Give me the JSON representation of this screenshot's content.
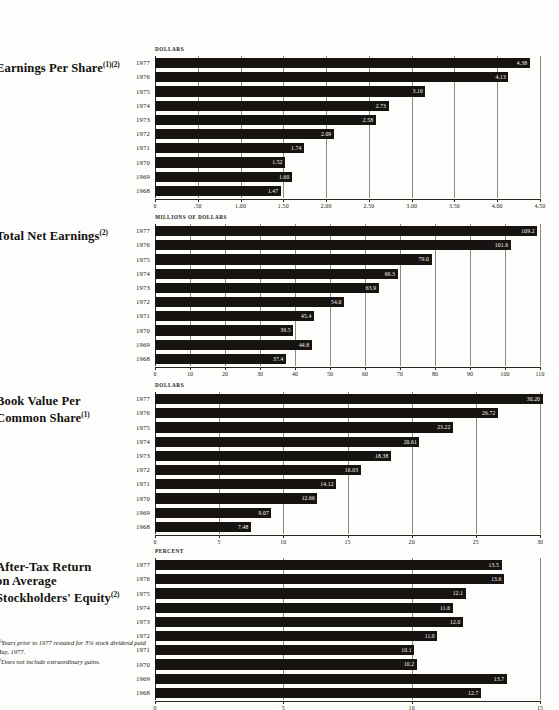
{
  "charts": [
    {
      "id": "earnings-per-share",
      "title_lines": [
        "Earnings Per Share"
      ],
      "title_sup": "(1)(2)",
      "unit_caption": "DOLLARS",
      "chart_data": {
        "type": "bar",
        "orientation": "horizontal",
        "title": "Earnings Per Share",
        "xlabel": "DOLLARS",
        "ylabel": "",
        "xlim": [
          0,
          4.5
        ],
        "grid": true,
        "legend": "none",
        "categories": [
          "1977",
          "1976",
          "1975",
          "1974",
          "1973",
          "1972",
          "1971",
          "1970",
          "1969",
          "1968"
        ],
        "values": [
          4.38,
          4.13,
          3.16,
          2.73,
          2.58,
          2.09,
          1.74,
          1.52,
          1.6,
          1.47
        ],
        "value_labels": [
          "4.38",
          "4.13",
          "3.16",
          "2.73",
          "2.58",
          "2.09",
          "1.74",
          "1.52",
          "1.60",
          "1.47"
        ],
        "ticks": [
          0,
          0.5,
          1.0,
          1.5,
          2.0,
          2.5,
          3.0,
          3.5,
          4.0,
          4.5
        ],
        "tick_labels": [
          "0",
          ".50",
          "1.00",
          "1.50",
          "2.00",
          "2.50",
          "3.00",
          "3.50",
          "4.00",
          "4.50"
        ]
      }
    },
    {
      "id": "total-net-earnings",
      "title_lines": [
        "Total Net Earnings"
      ],
      "title_sup": "(2)",
      "unit_caption": "MILLIONS OF DOLLARS",
      "chart_data": {
        "type": "bar",
        "orientation": "horizontal",
        "title": "Total Net Earnings",
        "xlabel": "MILLIONS OF DOLLARS",
        "ylabel": "",
        "xlim": [
          0,
          110
        ],
        "grid": true,
        "legend": "none",
        "categories": [
          "1977",
          "1976",
          "1975",
          "1974",
          "1973",
          "1972",
          "1971",
          "1970",
          "1969",
          "1968"
        ],
        "values": [
          109.2,
          101.6,
          79.0,
          69.3,
          63.9,
          54.0,
          45.4,
          39.5,
          44.8,
          37.4
        ],
        "value_labels": [
          "109.2",
          "101.6",
          "79.0",
          "69.3",
          "63.9",
          "54.0",
          "45.4",
          "39.5",
          "44.8",
          "37.4"
        ],
        "ticks": [
          0,
          10,
          20,
          30,
          40,
          50,
          60,
          70,
          80,
          90,
          100,
          110
        ],
        "tick_labels": [
          "0",
          "10",
          "20",
          "30",
          "40",
          "50",
          "60",
          "70",
          "80",
          "90",
          "100",
          "110"
        ]
      }
    },
    {
      "id": "book-value-per-common-share",
      "title_lines": [
        "Book Value Per",
        "Common Share"
      ],
      "title_sup": "(1)",
      "unit_caption": "DOLLARS",
      "chart_data": {
        "type": "bar",
        "orientation": "horizontal",
        "title": "Book Value Per Common Share",
        "xlabel": "DOLLARS",
        "ylabel": "",
        "xlim": [
          0,
          30
        ],
        "grid": true,
        "legend": "none",
        "categories": [
          "1977",
          "1976",
          "1975",
          "1974",
          "1973",
          "1972",
          "1971",
          "1970",
          "1969",
          "1968"
        ],
        "values": [
          30.2,
          26.72,
          23.22,
          20.61,
          18.38,
          16.03,
          14.12,
          12.66,
          9.07,
          7.48
        ],
        "value_labels": [
          "30.20",
          "26.72",
          "23.22",
          "20.61",
          "18.38",
          "16.03",
          "14.12",
          "12.66",
          "9.07",
          "7.48"
        ],
        "ticks": [
          0,
          5,
          10,
          15,
          20,
          25,
          30
        ],
        "tick_labels": [
          "0",
          "5",
          "10",
          "15",
          "20",
          "25",
          "30"
        ]
      }
    },
    {
      "id": "after-tax-return-on-average-stockholders-equity",
      "title_lines": [
        "After-Tax Return",
        "on Average",
        "Stockholders' Equity"
      ],
      "title_sup": "(2)",
      "unit_caption": "PERCENT",
      "chart_data": {
        "type": "bar",
        "orientation": "horizontal",
        "title": "After-Tax Return on Average Stockholders' Equity",
        "xlabel": "PERCENT",
        "ylabel": "",
        "xlim": [
          0,
          15
        ],
        "grid": true,
        "legend": "none",
        "categories": [
          "1977",
          "1976",
          "1975",
          "1974",
          "1973",
          "1972",
          "1971",
          "1970",
          "1969",
          "1968"
        ],
        "values": [
          13.5,
          13.6,
          12.1,
          11.6,
          12.0,
          11.0,
          10.1,
          10.2,
          13.7,
          12.7
        ],
        "value_labels": [
          "13.5",
          "13.6",
          "12.1",
          "11.6",
          "12.0",
          "11.0",
          "10.1",
          "10.2",
          "13.7",
          "12.7"
        ],
        "ticks": [
          0,
          5,
          10,
          15
        ],
        "tick_labels": [
          "0",
          "5",
          "10",
          "15"
        ]
      }
    }
  ],
  "footnotes": [
    {
      "marker": "(1)",
      "text": "Years prior to 1977 restated for 3% stock dividend paid May, 1977."
    },
    {
      "marker": "(2)",
      "text": "Does not include extraordinary gains."
    }
  ],
  "colors": {
    "bar": "#161310",
    "page_background": "#fdfdfb",
    "gridline": "#8d8a84",
    "axis": "#2a2722",
    "text": "#17140f",
    "value_label_text": "#fdfdfb"
  }
}
